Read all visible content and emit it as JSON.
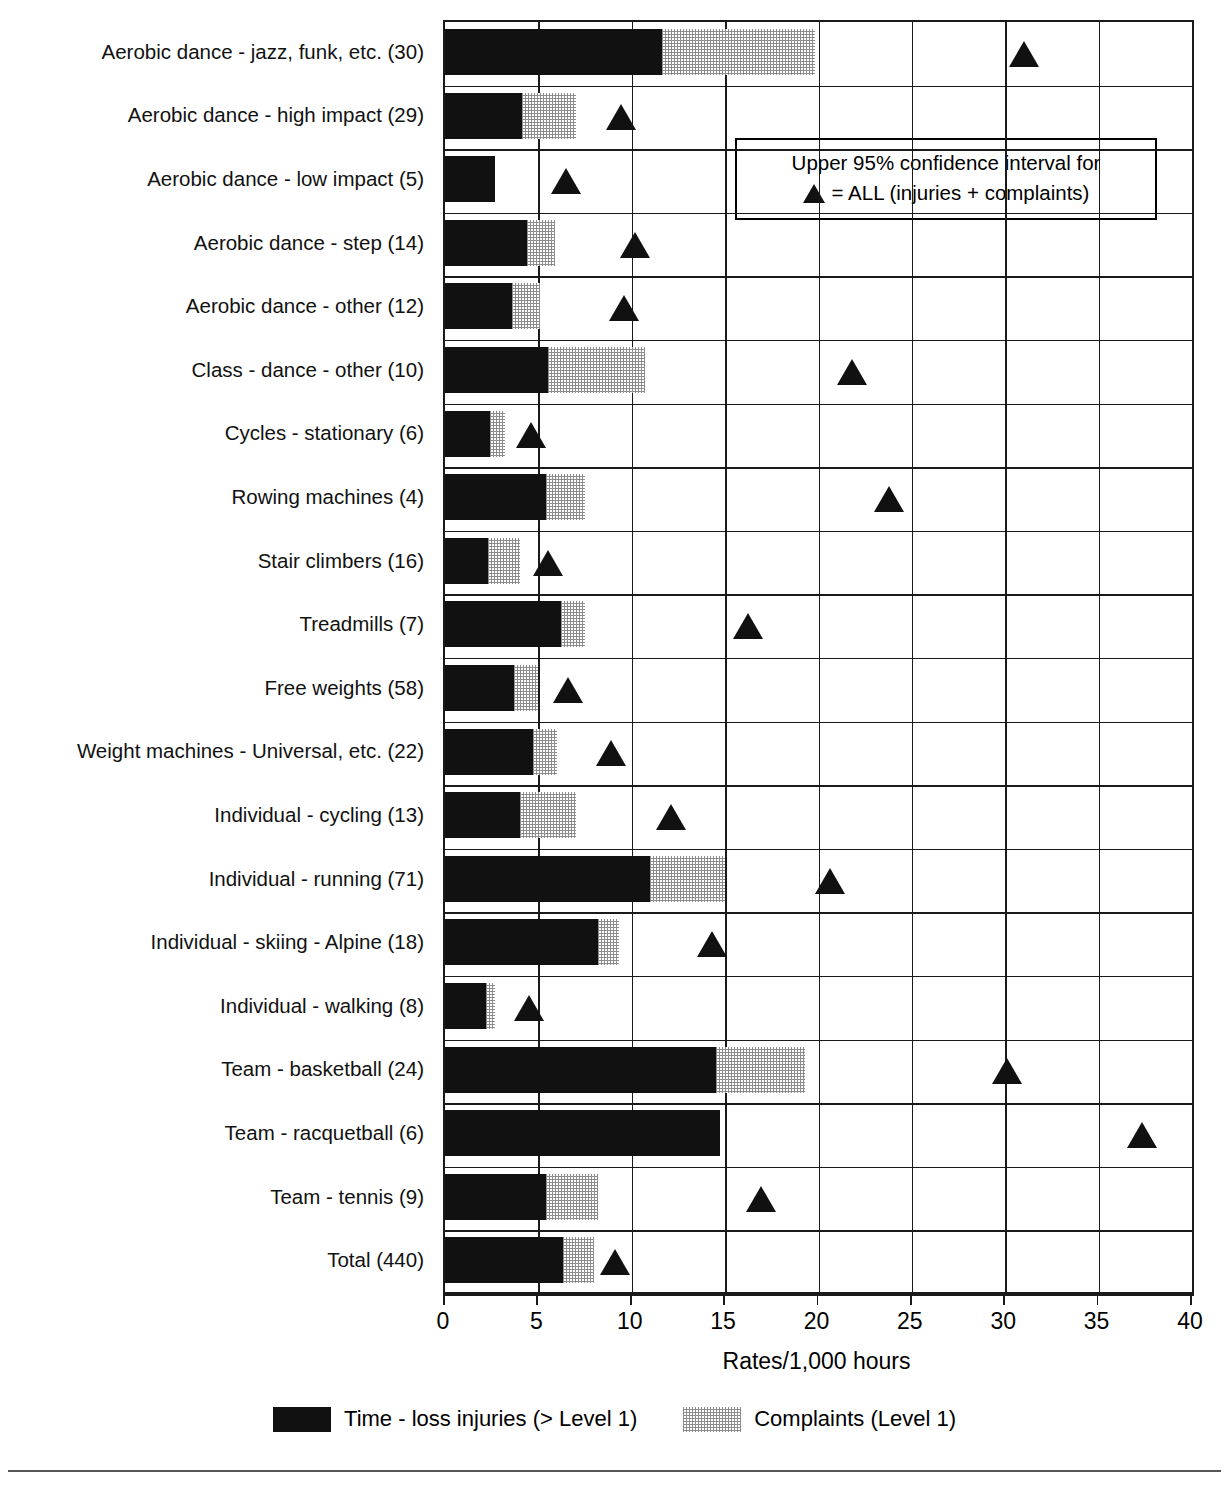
{
  "chart_data": {
    "type": "bar",
    "title": "",
    "subtitle": "",
    "xlabel": "Rates/1,000 hours",
    "ylabel": "",
    "xlim": [
      0,
      40
    ],
    "xticks": [
      0,
      5,
      10,
      15,
      20,
      25,
      30,
      35,
      40
    ],
    "xticklabels": [
      "0",
      "5",
      "10",
      "15",
      "20",
      "25",
      "30",
      "35",
      "40"
    ],
    "grid": "vertical-and-horizontal",
    "orientation": "horizontal",
    "stacked": true,
    "legend_position": "bottom",
    "categories": [
      "Aerobic dance - jazz, funk, etc. (30)",
      "Aerobic dance - high impact (29)",
      "Aerobic dance - low impact (5)",
      "Aerobic dance - step (14)",
      "Aerobic dance - other (12)",
      "Class - dance - other (10)",
      "Cycles - stationary (6)",
      "Rowing machines (4)",
      "Stair climbers (16)",
      "Treadmills (7)",
      "Free weights (58)",
      "Weight machines - Universal, etc. (22)",
      "Individual - cycling (13)",
      "Individual - running (71)",
      "Individual - skiing - Alpine (18)",
      "Individual - walking (8)",
      "Team - basketball (24)",
      "Team - racquetball (6)",
      "Team - tennis (9)",
      "Total (440)"
    ],
    "series": [
      {
        "name": "Time - loss injuries (> Level 1)",
        "color": "#111111",
        "values": [
          11.6,
          4.1,
          2.7,
          4.4,
          3.6,
          5.5,
          2.4,
          5.4,
          2.3,
          6.2,
          3.7,
          4.7,
          4.0,
          11.0,
          8.2,
          2.2,
          14.5,
          14.7,
          5.4,
          6.3
        ]
      },
      {
        "name": "Complaints (Level 1)",
        "color": "#8d8d8d",
        "values": [
          8.2,
          2.9,
          0.0,
          1.5,
          1.5,
          5.2,
          0.8,
          2.1,
          1.7,
          1.3,
          1.3,
          1.3,
          3.0,
          4.0,
          1.1,
          0.5,
          4.8,
          0.0,
          2.8,
          1.7
        ]
      }
    ],
    "totals": [
      19.8,
      7.0,
      2.7,
      5.9,
      5.1,
      10.7,
      3.2,
      7.5,
      4.0,
      7.5,
      5.0,
      6.0,
      7.0,
      15.0,
      9.3,
      2.7,
      19.3,
      14.7,
      8.2,
      8.0
    ],
    "markers": {
      "name": "Upper 95% confidence interval for ALL (injuries + complaints)",
      "symbol": "triangle",
      "color": "#111111",
      "values": [
        31.0,
        9.4,
        6.5,
        10.2,
        9.6,
        21.8,
        4.6,
        23.8,
        5.5,
        16.2,
        6.6,
        8.9,
        12.1,
        20.6,
        14.3,
        4.5,
        30.1,
        37.3,
        16.9,
        9.1
      ]
    }
  },
  "annotation_box": {
    "line1": "Upper 95% confidence interval for",
    "line2_prefix": "",
    "line2": "= ALL (injuries + complaints)"
  },
  "legend": {
    "items": [
      {
        "label": "Time - loss injuries (> Level 1)",
        "swatch": "dark"
      },
      {
        "label": "Complaints (Level 1)",
        "swatch": "light"
      }
    ]
  }
}
